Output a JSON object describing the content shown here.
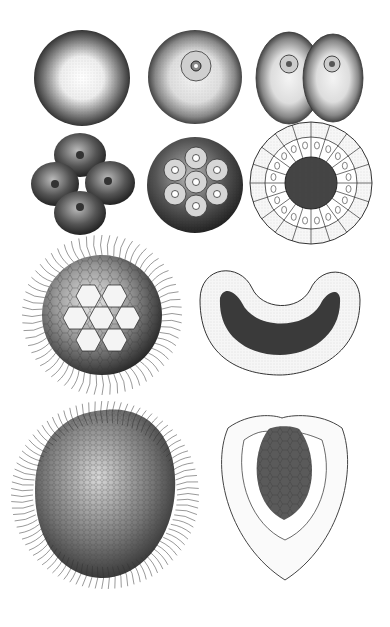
{
  "plate": {
    "description": "Engraved plate of early embryonic development stages",
    "background": "#ffffff",
    "ink": "#1a1a1a",
    "figures": [
      {
        "id": "zygote",
        "label": "Egg cell"
      },
      {
        "id": "nucleated-egg",
        "label": "Egg with nucleus"
      },
      {
        "id": "two-cell",
        "label": "Two-cell stage"
      },
      {
        "id": "four-cell",
        "label": "Four-cell stage"
      },
      {
        "id": "morula",
        "label": "Morula"
      },
      {
        "id": "blastula-section",
        "label": "Blastula cross-section"
      },
      {
        "id": "ciliated-blastula",
        "label": "Ciliated blastula"
      },
      {
        "id": "invaginating-gastrula",
        "label": "Invaginating gastrula section"
      },
      {
        "id": "ciliated-gastrula",
        "label": "Ciliated gastrula"
      },
      {
        "id": "gastrula-section",
        "label": "Gastrula section"
      }
    ]
  }
}
